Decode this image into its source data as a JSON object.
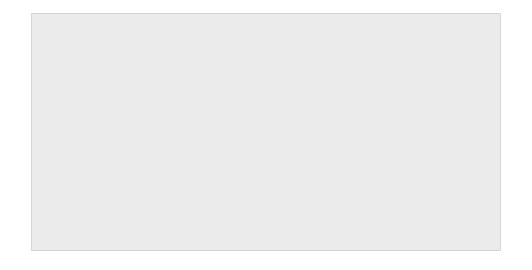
{
  "figure": {
    "background": "#ffffff",
    "panel_color": "#ebebeb",
    "line_color": "#555f6b"
  },
  "chart_data": {
    "type": "line",
    "title": "",
    "ylabel": "Percentage",
    "xlabel": "",
    "xlim": [
      1976,
      2007
    ],
    "ylim": [
      0,
      30
    ],
    "grid": false,
    "legend_position": "top-right",
    "ytick_labels": [
      "0",
      "5",
      "10",
      "15",
      "20",
      "25",
      "30"
    ],
    "yticks": [
      0,
      5,
      10,
      15,
      20,
      25,
      30
    ],
    "xtick_labels": [
      "1976",
      "1980",
      "1985",
      "1990",
      "1995",
      "2000",
      "2005",
      "2007"
    ],
    "xticks": [
      1976,
      1980,
      1985,
      1990,
      1995,
      2000,
      2005,
      2007
    ],
    "x": [
      1976,
      1977,
      1978,
      1979,
      1980,
      1981,
      1982,
      1983,
      1984,
      1985,
      1986,
      1987,
      1988,
      1989,
      1990,
      1991,
      1992,
      1993,
      1994,
      1995,
      1996,
      1997,
      1998,
      1999,
      2000,
      2001,
      2002,
      2003,
      2004,
      2005,
      2006,
      2007
    ],
    "series": [
      {
        "name": "Under 18 years",
        "marker": "square",
        "values": [
          13.6,
          13.4,
          13.3,
          13.3,
          14.1,
          15.2,
          16.3,
          17.2,
          16.4,
          16.0,
          15.7,
          15.4,
          15.1,
          15.4,
          15.9,
          17.2,
          17.8,
          17.9,
          17.3,
          16.9,
          16.5,
          16.1,
          15.2,
          14.1,
          13.4,
          13.8,
          14.2,
          14.6,
          14.3,
          14.0,
          13.3,
          10.3
        ]
      },
      {
        "name": "18-64 years",
        "marker": "circle",
        "values": [
          10.5,
          10.2,
          10.0,
          10.1,
          10.8,
          11.4,
          12.1,
          12.6,
          11.9,
          11.6,
          11.3,
          11.1,
          11.0,
          11.2,
          11.7,
          12.5,
          13.1,
          13.6,
          13.4,
          13.2,
          13.8,
          14.1,
          14.6,
          14.5,
          13.8,
          13.1,
          12.9,
          13.2,
          13.4,
          13.1,
          12.7,
          10.2
        ]
      },
      {
        "name": "65+ years",
        "marker": "triangle",
        "values": [
          29.3,
          29.9,
          30.0,
          29.4,
          28.3,
          26.1,
          24.4,
          22.2,
          19.8,
          19.8,
          17.6,
          16.7,
          16.1,
          14.7,
          13.5,
          15.1,
          13.9,
          12.5,
          12.1,
          11.3,
          11.7,
          11.6,
          10.7,
          10.0,
          9.8,
          9.3,
          9.1,
          8.7,
          9.5,
          8.9,
          8.5,
          5.0
        ]
      }
    ]
  },
  "legend": {
    "items": [
      {
        "label": "Under 18 years",
        "marker": "square"
      },
      {
        "label": "18–64 years",
        "marker": "circle"
      },
      {
        "label": "65+ years",
        "marker": "triangle"
      }
    ]
  }
}
